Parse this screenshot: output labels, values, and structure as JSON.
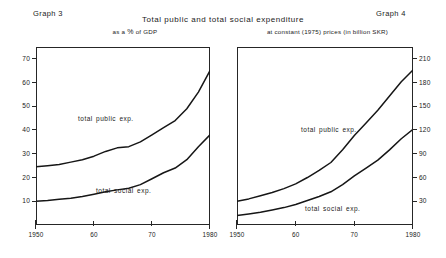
{
  "header": {
    "graph_left_number": "Graph 3",
    "graph_right_number": "Graph 4",
    "main_title": "Total public and total social expenditure",
    "subtitle_left_prefix": "as a",
    "subtitle_left_pct": "%",
    "subtitle_left_suffix": "of GDP",
    "subtitle_right": "at constant (1975) prices (in billion SKR)"
  },
  "chart_data": [
    {
      "id": "graph3",
      "type": "line",
      "title": "Graph 3",
      "subtitle": "as a % of GDP",
      "xlabel": "",
      "ylabel": "",
      "xlim": [
        1950,
        1980
      ],
      "ylim": [
        0,
        75
      ],
      "xticks": [
        1950,
        1960,
        1970,
        1980
      ],
      "xtick_labels": [
        "1950",
        "60",
        "70",
        "1980"
      ],
      "yticks": [
        10,
        20,
        30,
        40,
        50,
        60,
        70
      ],
      "ytick_labels": [
        "10",
        "20",
        "30",
        "40",
        "50",
        "60",
        "70"
      ],
      "y_axis_side": "left",
      "grid": false,
      "legend": "inline-annotations",
      "series": [
        {
          "name": "total public exp.",
          "label_text": "total public exp.",
          "x": [
            1950,
            1952,
            1954,
            1956,
            1958,
            1960,
            1962,
            1964,
            1966,
            1968,
            1970,
            1972,
            1974,
            1976,
            1978,
            1980
          ],
          "values": [
            24.5,
            25.0,
            25.5,
            26.5,
            27.5,
            29.0,
            31.0,
            32.5,
            33.0,
            35.0,
            38.0,
            41.0,
            44.0,
            49.0,
            56.0,
            65.0
          ]
        },
        {
          "name": "total social exp.",
          "label_text": "total social exp.",
          "x": [
            1950,
            1952,
            1954,
            1956,
            1958,
            1960,
            1962,
            1964,
            1966,
            1968,
            1970,
            1972,
            1974,
            1976,
            1978,
            1980
          ],
          "values": [
            10.0,
            10.3,
            10.8,
            11.3,
            12.0,
            13.0,
            14.0,
            14.8,
            15.5,
            17.0,
            19.5,
            22.0,
            24.0,
            27.5,
            33.0,
            38.0
          ]
        }
      ]
    },
    {
      "id": "graph4",
      "type": "line",
      "title": "Graph 4",
      "subtitle": "at constant (1975) prices (in billion SKR)",
      "xlabel": "",
      "ylabel": "",
      "xlim": [
        1950,
        1980
      ],
      "ylim": [
        0,
        225
      ],
      "xticks": [
        1950,
        1960,
        1970,
        1980
      ],
      "xtick_labels": [
        "1950",
        "60",
        "70",
        "1980"
      ],
      "yticks": [
        30,
        60,
        90,
        120,
        150,
        180,
        210
      ],
      "ytick_labels": [
        "30",
        "60",
        "90",
        "120",
        "150",
        "180",
        "210"
      ],
      "y_axis_side": "right",
      "grid": false,
      "legend": "inline-annotations",
      "series": [
        {
          "name": "total public exp.",
          "label_text": "total public exp.",
          "x": [
            1950,
            1952,
            1954,
            1956,
            1958,
            1960,
            1962,
            1964,
            1966,
            1968,
            1970,
            1972,
            1974,
            1976,
            1978,
            1980
          ],
          "values": [
            30,
            33,
            37,
            41,
            46,
            52,
            60,
            69,
            79,
            95,
            113,
            129,
            145,
            163,
            181,
            196
          ]
        },
        {
          "name": "total social exp.",
          "label_text": "total social exp.",
          "x": [
            1950,
            1952,
            1954,
            1956,
            1958,
            1960,
            1962,
            1964,
            1966,
            1968,
            1970,
            1972,
            1974,
            1976,
            1978,
            1980
          ],
          "values": [
            12,
            14,
            16,
            19,
            22,
            26,
            31,
            36,
            42,
            51,
            62,
            72,
            82,
            95,
            109,
            121
          ]
        }
      ]
    }
  ]
}
